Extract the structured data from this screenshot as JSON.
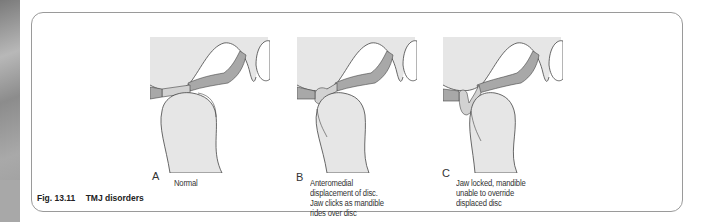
{
  "figure": {
    "number": "Fig. 13.11",
    "title": "TMJ disorders"
  },
  "panels": [
    {
      "letter": "A",
      "caption": "Normal"
    },
    {
      "letter": "B",
      "caption": "Anteromedial\ndisplacement of disc.\nJaw clicks as mandible\nrides over disc"
    },
    {
      "letter": "C",
      "caption": "Jaw locked, mandible\nunable to override\ndisplaced disc"
    }
  ],
  "colors": {
    "bone_fill": "#e6e6e6",
    "disc_fill": "#a8a8a8",
    "disc_light": "#d2d2d2",
    "outline": "#444444",
    "frame": "#9a9a9a"
  }
}
